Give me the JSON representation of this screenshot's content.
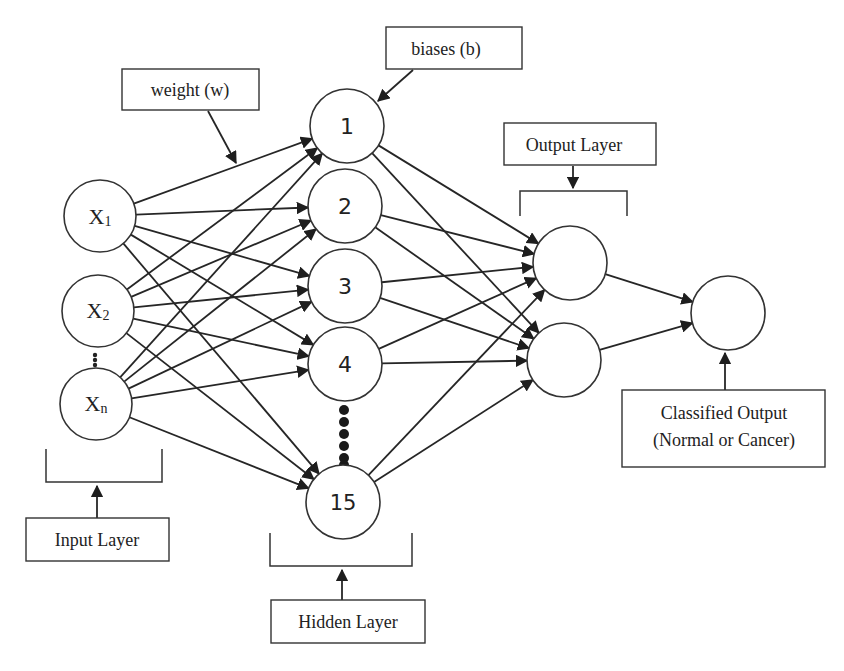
{
  "colors": {
    "stroke": "#2a2a2a",
    "background": "#ffffff"
  },
  "labels": {
    "weight": "weight (w)",
    "biases": "biases (b)",
    "output_layer": "Output Layer",
    "input_layer": "Input Layer",
    "hidden_layer": "Hidden Layer",
    "classified_line1": "Classified Output",
    "classified_line2": "(Normal or Cancer)"
  },
  "input_nodes": [
    {
      "base": "X",
      "sub": "1"
    },
    {
      "base": "X",
      "sub": "2"
    },
    {
      "base": "X",
      "sub": "n"
    }
  ],
  "hidden_nodes": [
    "1",
    "2",
    "3",
    "4",
    "15"
  ],
  "output_nodes": [
    "",
    ""
  ],
  "final_node": ""
}
